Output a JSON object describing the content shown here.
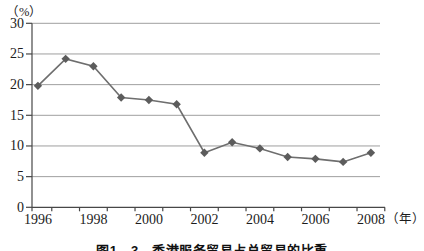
{
  "figure": {
    "y_unit_label": "（%）",
    "x_unit_label": "（年）",
    "caption": "图1—3　香港服务贸易占总贸易的比重"
  },
  "chart_data": {
    "type": "line",
    "categories": [
      "1996",
      "1997",
      "1998",
      "1999",
      "2000",
      "2001",
      "2002",
      "2003",
      "2004",
      "2005",
      "2006",
      "2007",
      "2008"
    ],
    "values": [
      19.8,
      24.2,
      23.0,
      17.9,
      17.5,
      16.8,
      8.9,
      10.6,
      9.6,
      8.2,
      7.9,
      7.4,
      8.9
    ],
    "xlabel": "（年）",
    "ylabel": "（%）",
    "ylim": [
      0,
      30
    ],
    "y_ticks": [
      0,
      5,
      10,
      15,
      20,
      25,
      30
    ],
    "x_labeled_ticks": [
      "1996",
      "1998",
      "2000",
      "2002",
      "2004",
      "2006",
      "2008"
    ],
    "grid": true,
    "legend": false,
    "marker": "diamond",
    "line_color": "#6e6e6e",
    "marker_color": "#5c5c5c",
    "gridline_color": "#9f9f9f",
    "axis_color": "#474747",
    "text_color": "#1c1c1c",
    "background": "#ffffff"
  }
}
